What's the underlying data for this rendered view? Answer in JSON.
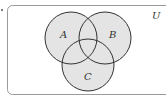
{
  "diagram": {
    "type": "venn",
    "universe_label": "U",
    "sets": [
      {
        "label": "A",
        "cx": 71,
        "cy": 38,
        "r": 26
      },
      {
        "label": "B",
        "cx": 105,
        "cy": 38,
        "r": 26
      },
      {
        "label": "C",
        "cx": 88,
        "cy": 65,
        "r": 26
      }
    ],
    "colors": {
      "fill": "#e4e4e4",
      "stroke": "#333333",
      "frame": "#9a9a9a"
    }
  }
}
